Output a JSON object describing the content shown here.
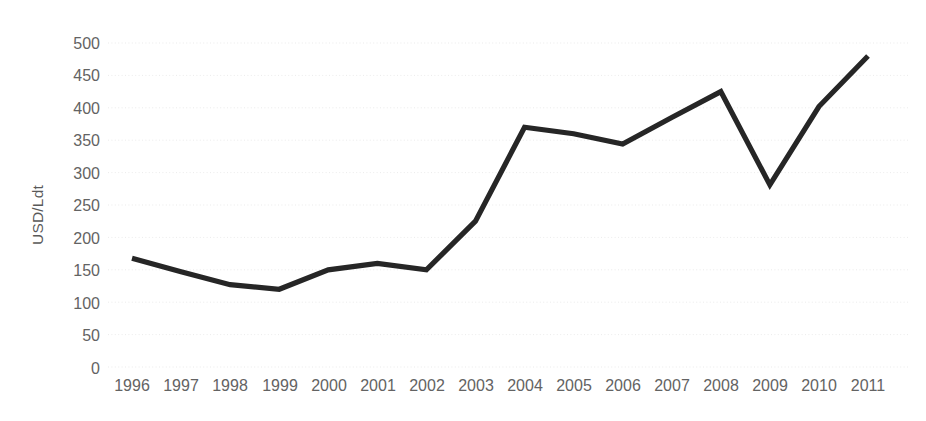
{
  "chart_data": {
    "type": "line",
    "title": "",
    "xlabel": "",
    "ylabel": "USD/Ldt",
    "categories": [
      "1996",
      "1997",
      "1998",
      "1999",
      "2000",
      "2001",
      "2002",
      "2003",
      "2004",
      "2005",
      "2006",
      "2007",
      "2008",
      "2009",
      "2010",
      "2011"
    ],
    "values": [
      168,
      147,
      127,
      120,
      150,
      160,
      150,
      225,
      370,
      360,
      344,
      385,
      425,
      281,
      402,
      480
    ],
    "series": [
      {
        "name": "USD/Ldt",
        "values": [
          168,
          147,
          127,
          120,
          150,
          160,
          150,
          225,
          370,
          360,
          344,
          385,
          425,
          281,
          402,
          480
        ]
      }
    ],
    "ylim": [
      0,
      500
    ],
    "y_ticks": [
      0,
      50,
      100,
      150,
      200,
      250,
      300,
      350,
      400,
      450,
      500
    ],
    "y_tick_labels": [
      "0",
      "50",
      "100",
      "150",
      "200",
      "250",
      "300",
      "350",
      "400",
      "450",
      "500"
    ],
    "x_tick_labels": [
      "1996",
      "1997",
      "1998",
      "1999",
      "2000",
      "2001",
      "2002",
      "2003",
      "2004",
      "2005",
      "2006",
      "2007",
      "2008",
      "2009",
      "2010",
      "2011"
    ],
    "grid": true,
    "grid_axis": "y",
    "legend": false,
    "legend_position": "none",
    "line_color": "#262626",
    "grid_color": "#e9e9e9",
    "tick_label_color": "#636363",
    "axis_title_color": "#595959",
    "background_color": "#ffffff"
  }
}
